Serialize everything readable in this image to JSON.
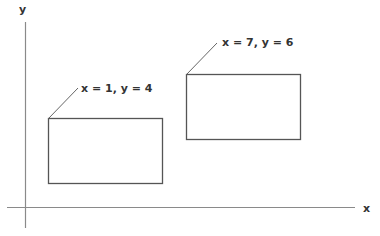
{
  "diagram": {
    "axes": {
      "x_label": "x",
      "y_label": "y",
      "axis_color": "#8a8a8a"
    },
    "rectangles": [
      {
        "label": "x = 1, y = 4",
        "x": 1,
        "y": 4
      },
      {
        "label": "x = 7, y = 6",
        "x": 7,
        "y": 6
      }
    ],
    "stroke_color": "#555555",
    "text_color": "#333333"
  }
}
